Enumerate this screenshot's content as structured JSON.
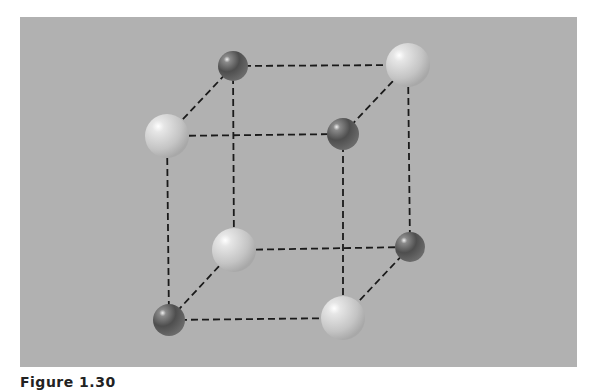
{
  "figure": {
    "caption": "Figure 1.30",
    "background_color": "#b1b1b1",
    "edge_style": "dashed",
    "edge_color": "#1a1a1a"
  },
  "atoms": [
    {
      "id": "back-top-left",
      "type": "dark",
      "x": 233,
      "y": 66,
      "r": 15
    },
    {
      "id": "back-top-right",
      "type": "light",
      "x": 408,
      "y": 65,
      "r": 22
    },
    {
      "id": "front-top-left",
      "type": "light",
      "x": 167,
      "y": 136,
      "r": 22
    },
    {
      "id": "front-top-right",
      "type": "dark",
      "x": 343,
      "y": 134,
      "r": 16
    },
    {
      "id": "back-bottom-left",
      "type": "light",
      "x": 234,
      "y": 250,
      "r": 22
    },
    {
      "id": "back-bottom-right",
      "type": "dark",
      "x": 410,
      "y": 247,
      "r": 15
    },
    {
      "id": "front-bottom-left",
      "type": "dark",
      "x": 169,
      "y": 320,
      "r": 16
    },
    {
      "id": "front-bottom-right",
      "type": "light",
      "x": 343,
      "y": 318,
      "r": 22
    }
  ],
  "edges": [
    [
      "back-top-left",
      "back-top-right"
    ],
    [
      "back-top-left",
      "front-top-left"
    ],
    [
      "back-top-right",
      "front-top-right"
    ],
    [
      "front-top-left",
      "front-top-right"
    ],
    [
      "back-top-left",
      "back-bottom-left"
    ],
    [
      "back-top-right",
      "back-bottom-right"
    ],
    [
      "front-top-left",
      "front-bottom-left"
    ],
    [
      "front-top-right",
      "front-bottom-right"
    ],
    [
      "back-bottom-left",
      "back-bottom-right"
    ],
    [
      "back-bottom-left",
      "front-bottom-left"
    ],
    [
      "back-bottom-right",
      "front-bottom-right"
    ],
    [
      "front-bottom-left",
      "front-bottom-right"
    ]
  ]
}
